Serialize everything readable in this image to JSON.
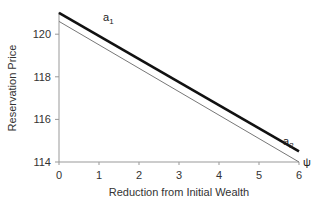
{
  "chart_data": {
    "type": "line",
    "title": "",
    "xlabel": "Reduction from Initial Wealth",
    "ylabel": "Reservation Price",
    "xlim": [
      0,
      6
    ],
    "ylim": [
      114,
      121
    ],
    "x_ticks": [
      "0",
      "1",
      "2",
      "3",
      "4",
      "5",
      "6"
    ],
    "y_ticks": [
      "114",
      "116",
      "118",
      "120"
    ],
    "grid": false,
    "legend": "none",
    "series": [
      {
        "name": "a1",
        "style": "thick",
        "x": [
          0,
          6
        ],
        "values": [
          121.0,
          114.5
        ]
      },
      {
        "name": "a2",
        "style": "thin",
        "x": [
          0,
          6
        ],
        "values": [
          120.6,
          114.0
        ]
      }
    ],
    "annotations": [
      {
        "text": "a1",
        "base": "a",
        "sub": "1",
        "x": 1.1,
        "y": 120.6
      },
      {
        "text": "a2",
        "base": "a",
        "sub": "2",
        "x": 5.6,
        "y": 114.8
      },
      {
        "text": "ψ",
        "x": 6.1,
        "y": 114
      }
    ]
  }
}
